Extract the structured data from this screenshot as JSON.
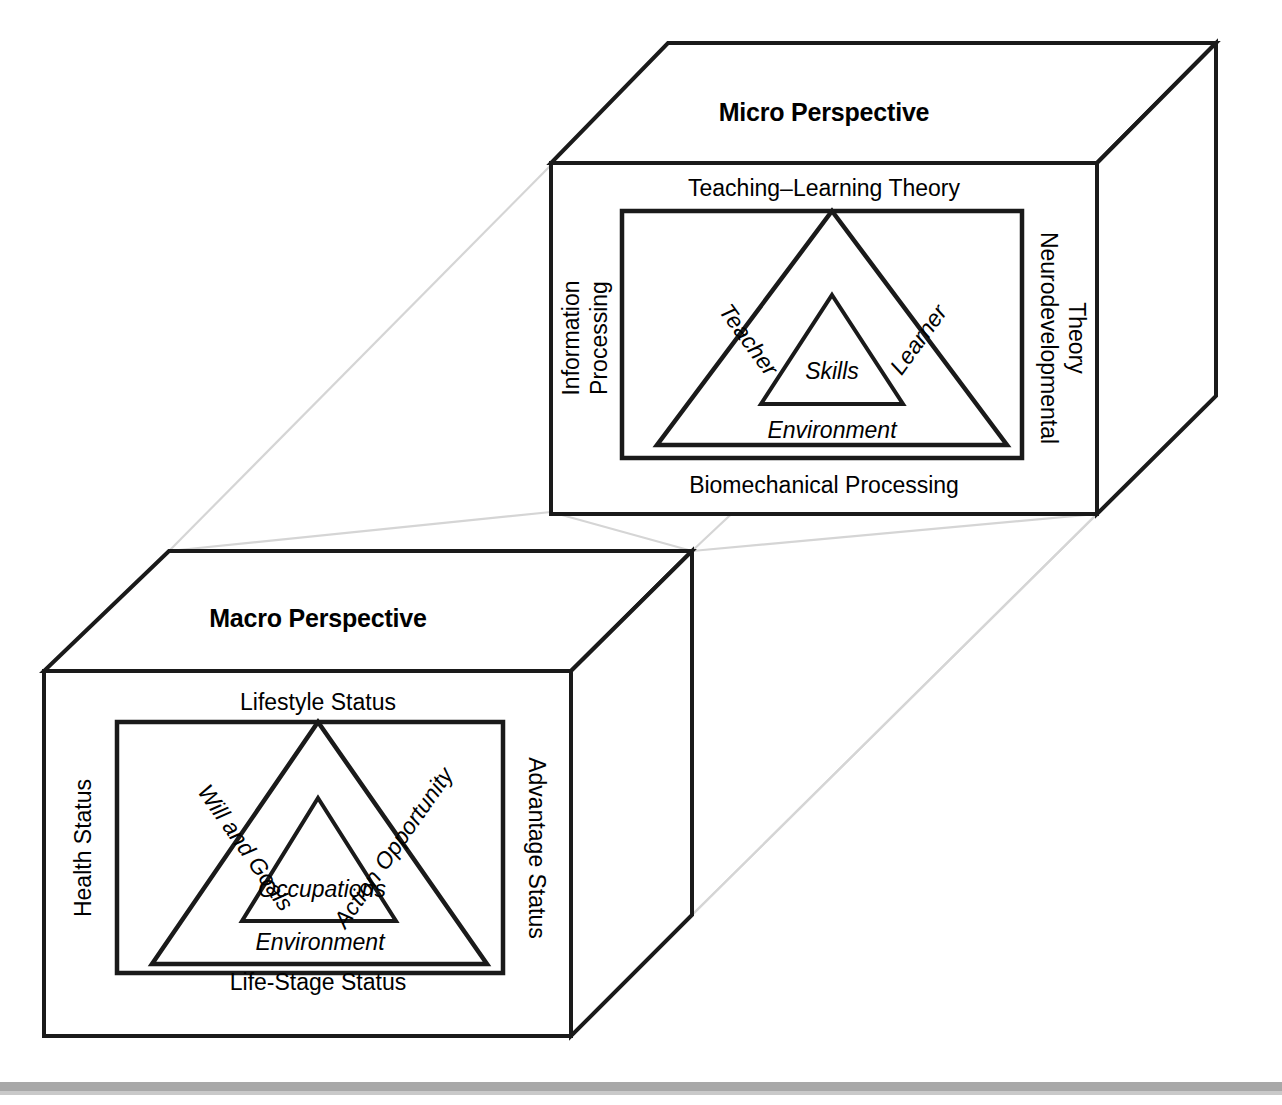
{
  "figure": {
    "connector_color": "#d5d5d5",
    "line_color": "#1a1a1a",
    "background_color": "#ffffff",
    "baseline_bar_color": "#a8a8a8"
  },
  "micro_cube": {
    "title": "Micro Perspective",
    "front_face": {
      "top_label": "Teaching–Learning Theory",
      "bottom_label": "Biomechanical Processing",
      "left_label_line1": "Information",
      "left_label_line2": "Processing",
      "right_label_line1": "Neurodevelopmental",
      "right_label_line2": "Theory"
    },
    "triangle": {
      "left_side": "Teacher",
      "right_side": "Learner",
      "base_label": "Environment",
      "core_label": "Skills"
    }
  },
  "macro_cube": {
    "title": "Macro Perspective",
    "front_face": {
      "top_label": "Lifestyle Status",
      "bottom_label": "Life-Stage Status",
      "left_label": "Health Status",
      "right_label": "Advantage Status"
    },
    "triangle": {
      "left_side": "Will and Goals",
      "right_side": "Action Opportunity",
      "base_label": "Environment",
      "core_label": "Occupations"
    }
  }
}
